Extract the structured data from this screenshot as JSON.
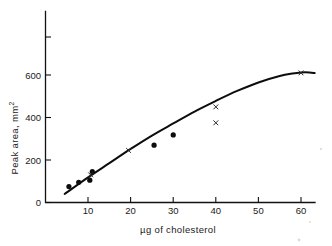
{
  "figure": {
    "name": "cholesterol-calibration-curve",
    "background": "#ffffff",
    "ink_color": "#0d0d0d"
  },
  "chart_data": {
    "type": "scatter",
    "title": "",
    "subtitle": "",
    "xlabel": "µg of cholesterol",
    "ylabel": "Peak area, mm²",
    "xlim": [
      0,
      63.5
    ],
    "ylim": [
      0,
      900
    ],
    "grid": false,
    "legend": "none",
    "xticks": [
      10,
      20,
      30,
      40,
      50,
      60
    ],
    "xtick_labels": [
      "10",
      "20",
      "30",
      "40",
      "50",
      "60"
    ],
    "yticks": [
      0,
      200,
      400,
      600,
      800
    ],
    "ytick_labels": [
      "0",
      "200",
      "400",
      "600",
      ""
    ],
    "series": [
      {
        "name": "filled-circle-points",
        "marker": "circle",
        "marker_color": "#0d0d0d",
        "points": [
          {
            "x": 5.5,
            "y": 75
          },
          {
            "x": 7.8,
            "y": 95
          },
          {
            "x": 10.4,
            "y": 105
          },
          {
            "x": 11.0,
            "y": 145
          },
          {
            "x": 25.5,
            "y": 270
          },
          {
            "x": 30.0,
            "y": 318
          }
        ]
      },
      {
        "name": "cross-points",
        "marker": "x",
        "marker_color": "#2a2a2a",
        "points": [
          {
            "x": 10.6,
            "y": 130
          },
          {
            "x": 19.5,
            "y": 245
          },
          {
            "x": 40.0,
            "y": 450
          },
          {
            "x": 40.0,
            "y": 375
          },
          {
            "x": 60.0,
            "y": 610
          }
        ]
      },
      {
        "name": "fitted-calibration-curve",
        "marker": "none",
        "line_color": "#0d0d0d",
        "points": [
          {
            "x": 4.5,
            "y": 40
          },
          {
            "x": 10,
            "y": 118
          },
          {
            "x": 15,
            "y": 185
          },
          {
            "x": 20,
            "y": 252
          },
          {
            "x": 25,
            "y": 315
          },
          {
            "x": 30,
            "y": 372
          },
          {
            "x": 35,
            "y": 428
          },
          {
            "x": 40,
            "y": 478
          },
          {
            "x": 45,
            "y": 525
          },
          {
            "x": 50,
            "y": 565
          },
          {
            "x": 55,
            "y": 595
          },
          {
            "x": 58,
            "y": 607
          },
          {
            "x": 60,
            "y": 612
          },
          {
            "x": 62,
            "y": 612
          },
          {
            "x": 63.2,
            "y": 609
          }
        ]
      }
    ]
  },
  "axes": {
    "y_axis_label": "Peak area, mm",
    "y_axis_label_sup": "2",
    "x_axis_label": "µg of cholesterol"
  }
}
